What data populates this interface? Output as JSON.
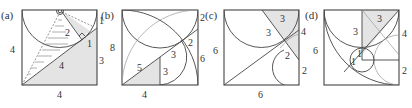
{
  "figure": {
    "panels": [
      {
        "id": "a",
        "label": "(a)",
        "labels": {
          "left": "4",
          "bottom": "4",
          "right": "3",
          "top_right": "1",
          "hyp_mid": "4",
          "inner_1": "1",
          "inner_2": "2"
        }
      },
      {
        "id": "b",
        "label": "(b)",
        "labels": {
          "left": "8",
          "bottom": "4",
          "right": "6",
          "top_right": "2",
          "inner_2": "2",
          "diag_3": "3",
          "vert_3": "3",
          "hyp_5": "5"
        }
      },
      {
        "id": "c",
        "label": "(c)",
        "labels": {
          "left": "6",
          "bottom": "6",
          "right": "2",
          "top_shade": "3",
          "left_3": "3",
          "right_4": "4",
          "inner_2": "2"
        }
      },
      {
        "id": "d",
        "label": "(d)",
        "labels": {
          "left": "6",
          "right_bottom": "2",
          "right_mid": "4",
          "top_shade": "3",
          "left_3": "3",
          "circle_1a": "1",
          "circle_1b": "1"
        }
      }
    ]
  }
}
